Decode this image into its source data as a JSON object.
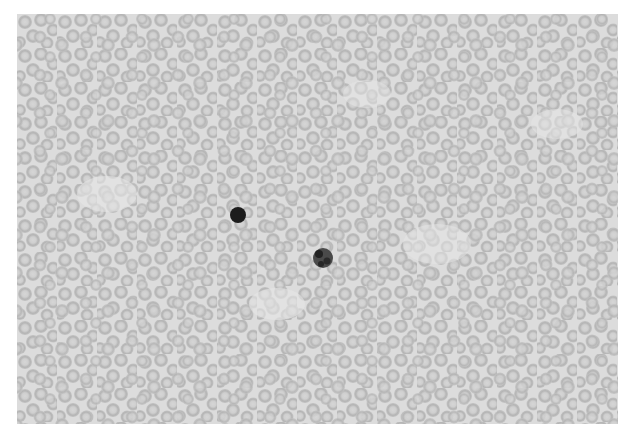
{
  "image": {
    "description": "Grayscale micrograph of a blood smear showing densely packed red blood cells with two dark-staining white blood cells",
    "background_color": "#ffffff",
    "field_color": "#d9d9d9",
    "rbc_color": "#b8b8b8",
    "rbc_center_color": "#d0d0d0",
    "frame": {
      "x": 17,
      "y": 14,
      "width": 601,
      "height": 410
    }
  },
  "features": [
    {
      "name": "lymphocyte",
      "x": 238,
      "y": 215,
      "r": 8,
      "color": "#1a1a1a"
    },
    {
      "name": "neutrophil",
      "x": 323,
      "y": 258,
      "r": 10,
      "color": "#3a3a3a"
    }
  ]
}
